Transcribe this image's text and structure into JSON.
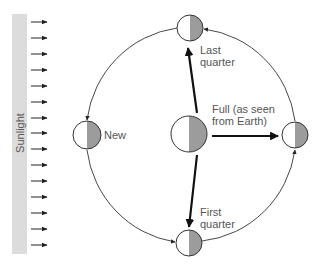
{
  "diagram": {
    "sunlight_label": "Sunlight",
    "sunlight_arrow_count": 15,
    "earth_label": "",
    "phases": [
      {
        "id": "new",
        "label_lines": [
          "New"
        ]
      },
      {
        "id": "first-quarter",
        "label_lines": [
          "First",
          "quarter"
        ]
      },
      {
        "id": "full",
        "label_lines": [
          "Full (as seen",
          "from Earth)"
        ]
      },
      {
        "id": "last-quarter",
        "label_lines": [
          "Last",
          "quarter"
        ]
      }
    ],
    "colors": {
      "sunlight_bar": "#dcdcdc",
      "dark_half": "#9c9c9c",
      "lit_half": "#ffffff",
      "outline": "#333333",
      "text": "#555555"
    }
  }
}
